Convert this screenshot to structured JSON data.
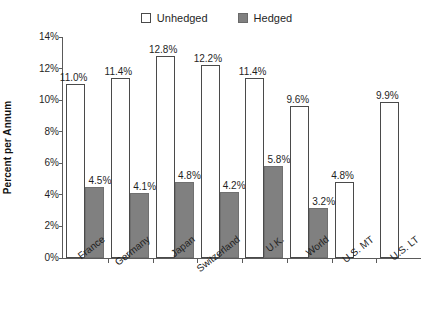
{
  "chart_data": {
    "type": "bar",
    "title": "",
    "subtitle": "",
    "xlabel": "",
    "ylabel": "Percent per Annum",
    "categories": [
      "France",
      "Germany",
      "Japan",
      "Switzerland",
      "U.K.",
      "World",
      "U.S. MT",
      "U.S. LT"
    ],
    "series": [
      {
        "name": "Unhedged",
        "color": "#ffffff",
        "border_color": "#4a4a4a",
        "values": [
          11.0,
          11.4,
          12.8,
          12.2,
          11.4,
          9.6,
          4.8,
          9.9
        ],
        "labels": [
          "11.0%",
          "11.4%",
          "12.8%",
          "12.2%",
          "11.4%",
          "9.6%",
          "4.8%",
          "9.9%"
        ]
      },
      {
        "name": "Hedged",
        "color": "#808080",
        "border_color": "#707070",
        "values": [
          4.5,
          4.1,
          4.8,
          4.2,
          5.8,
          3.2,
          null,
          null
        ],
        "labels": [
          "4.5%",
          "4.1%",
          "4.8%",
          "4.2%",
          "5.8%",
          "3.2%",
          "",
          ""
        ]
      }
    ],
    "ylim": [
      0,
      14
    ],
    "ytick_values": [
      0,
      2,
      4,
      6,
      8,
      10,
      12,
      14
    ],
    "ytick_labels": [
      "0%",
      "2%",
      "4%",
      "6%",
      "8%",
      "10%",
      "12%",
      "14%"
    ],
    "grid": false,
    "legend_position": "top-center",
    "value_labels_shown": true,
    "units": "percent"
  },
  "legend": {
    "entries": [
      {
        "label": "Unhedged",
        "swatch": "unhedged-swatch"
      },
      {
        "label": "Hedged",
        "swatch": "hedged-swatch"
      }
    ]
  },
  "axis": {
    "y_title": "Percent per Annum"
  }
}
